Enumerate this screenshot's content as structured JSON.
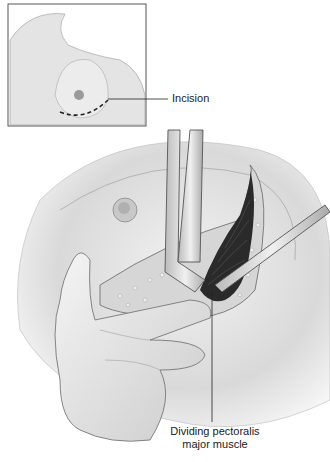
{
  "figure": {
    "type": "surgical illustration",
    "inset": {
      "description": "Anterior chest view showing breast with nipple and inframammary dashed incision line",
      "label": "Incision"
    },
    "main": {
      "description": "Retractor lifting breast tissue while finger and cautery divide pectoralis major muscle through incision",
      "label_line1": "Dividing pectoralis",
      "label_line2": "major muscle"
    },
    "colors": {
      "skin": "#e6e6e6",
      "skin_shadow": "#bdbdbd",
      "muscle": "#2a2a2a",
      "fat": "#cfcfcf",
      "instrument": "#d9d9d9",
      "outline": "#555555",
      "leader": "#222222"
    }
  }
}
